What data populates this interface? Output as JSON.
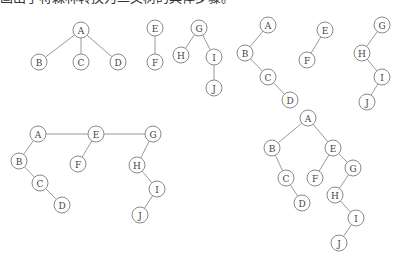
{
  "caption": "画出了将森林转换为二叉树的具体步骤。",
  "diagrams": [
    {
      "name": "forest-original",
      "trees": [
        {
          "root": "A",
          "nodes": [
            "A",
            "B",
            "C",
            "D"
          ],
          "edges": [
            [
              "A",
              "B"
            ],
            [
              "A",
              "C"
            ],
            [
              "A",
              "D"
            ]
          ]
        },
        {
          "root": "E",
          "nodes": [
            "E",
            "F"
          ],
          "edges": [
            [
              "E",
              "F"
            ]
          ]
        },
        {
          "root": "G",
          "nodes": [
            "G",
            "H",
            "I",
            "J"
          ],
          "edges": [
            [
              "G",
              "H"
            ],
            [
              "G",
              "I"
            ],
            [
              "I",
              "J"
            ]
          ]
        }
      ]
    },
    {
      "name": "each-tree-binarized",
      "trees": [
        {
          "root": "A",
          "nodes": [
            "A",
            "B",
            "C",
            "D"
          ],
          "edges": [
            [
              "A",
              "B"
            ],
            [
              "B",
              "C"
            ],
            [
              "C",
              "D"
            ]
          ]
        },
        {
          "root": "E",
          "nodes": [
            "E",
            "F"
          ],
          "edges": [
            [
              "E",
              "F"
            ]
          ]
        },
        {
          "root": "G",
          "nodes": [
            "G",
            "H",
            "I",
            "J"
          ],
          "edges": [
            [
              "G",
              "H"
            ],
            [
              "H",
              "I"
            ],
            [
              "I",
              "J"
            ]
          ]
        }
      ]
    },
    {
      "name": "roots-linked",
      "trees": [
        {
          "root": "A",
          "nodes": [
            "A",
            "B",
            "C",
            "D",
            "E",
            "F",
            "G",
            "H",
            "I",
            "J"
          ],
          "edges": [
            [
              "A",
              "E"
            ],
            [
              "E",
              "G"
            ],
            [
              "A",
              "B"
            ],
            [
              "B",
              "C"
            ],
            [
              "C",
              "D"
            ],
            [
              "E",
              "F"
            ],
            [
              "G",
              "H"
            ],
            [
              "H",
              "I"
            ],
            [
              "I",
              "J"
            ]
          ]
        }
      ]
    },
    {
      "name": "final-binary-tree",
      "trees": [
        {
          "root": "A",
          "nodes": [
            "A",
            "B",
            "C",
            "D",
            "E",
            "F",
            "G",
            "H",
            "I",
            "J"
          ],
          "edges": [
            [
              "A",
              "B"
            ],
            [
              "B",
              "C"
            ],
            [
              "C",
              "D"
            ],
            [
              "A",
              "E"
            ],
            [
              "E",
              "F"
            ],
            [
              "E",
              "G"
            ],
            [
              "G",
              "H"
            ],
            [
              "H",
              "I"
            ],
            [
              "I",
              "J"
            ]
          ]
        }
      ]
    }
  ]
}
